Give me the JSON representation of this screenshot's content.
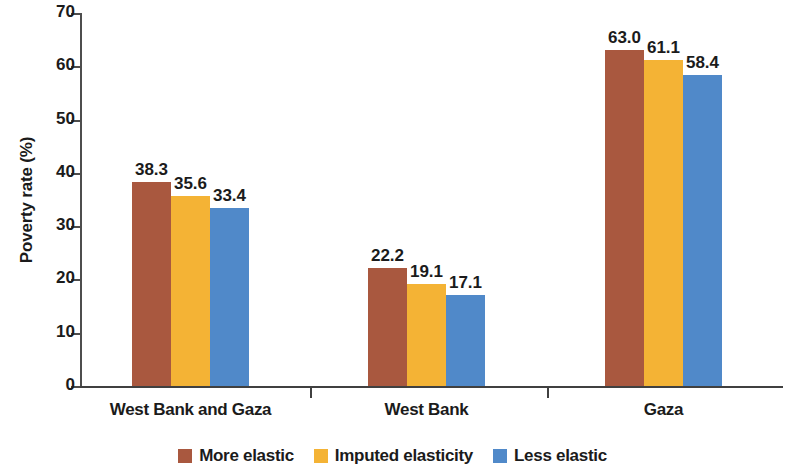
{
  "chart_data": {
    "type": "bar",
    "title": "",
    "xlabel": "",
    "ylabel": "Poverty rate (%)",
    "ylim": [
      0,
      70
    ],
    "yticks": [
      0,
      10,
      20,
      30,
      40,
      50,
      60,
      70
    ],
    "ytick_labels": [
      "0",
      "10",
      "20",
      "30",
      "40",
      "50",
      "60",
      "70"
    ],
    "grid": false,
    "legend_position": "bottom-center",
    "categories": [
      "West Bank and Gaza",
      "West Bank",
      "Gaza"
    ],
    "series": [
      {
        "name": "More elastic",
        "color": "#a9583f",
        "values": [
          38.3,
          63.0,
          22.2
        ],
        "value_labels": [
          "38.3",
          "22.2",
          "63.0"
        ]
      },
      {
        "name": "Imputed elasticity",
        "color": "#f4b335",
        "values": [
          35.6,
          19.1,
          61.1
        ],
        "value_labels": [
          "35.6",
          "19.1",
          "61.1"
        ]
      },
      {
        "name": "Less elastic",
        "color": "#5089c9",
        "values": [
          33.4,
          17.1,
          58.4
        ],
        "value_labels": [
          "33.4",
          "17.1",
          "58.4"
        ]
      }
    ],
    "groups": [
      {
        "category": "West Bank and Gaza",
        "bars": [
          {
            "series": "More elastic",
            "value": 38.3,
            "label": "38.3",
            "color": "#a9583f"
          },
          {
            "series": "Imputed elasticity",
            "value": 35.6,
            "label": "35.6",
            "color": "#f4b335"
          },
          {
            "series": "Less elastic",
            "value": 33.4,
            "label": "33.4",
            "color": "#5089c9"
          }
        ]
      },
      {
        "category": "West Bank",
        "bars": [
          {
            "series": "More elastic",
            "value": 22.2,
            "label": "22.2",
            "color": "#a9583f"
          },
          {
            "series": "Imputed elasticity",
            "value": 19.1,
            "label": "19.1",
            "color": "#f4b335"
          },
          {
            "series": "Less elastic",
            "value": 17.1,
            "label": "17.1",
            "color": "#5089c9"
          }
        ]
      },
      {
        "category": "Gaza",
        "bars": [
          {
            "series": "More elastic",
            "value": 63.0,
            "label": "63.0",
            "color": "#a9583f"
          },
          {
            "series": "Imputed elasticity",
            "value": 61.1,
            "label": "61.1",
            "color": "#f4b335"
          },
          {
            "series": "Less elastic",
            "value": 58.4,
            "label": "58.4",
            "color": "#5089c9"
          }
        ]
      }
    ]
  },
  "legend": {
    "items": [
      {
        "label": "More elastic",
        "color": "#a9583f"
      },
      {
        "label": "Imputed elasticity",
        "color": "#f4b335"
      },
      {
        "label": "Less elastic",
        "color": "#5089c9"
      }
    ]
  },
  "axes": {
    "y_title": "Poverty rate (%)",
    "y_tick_labels": [
      "70",
      "60",
      "50",
      "40",
      "30",
      "20",
      "10",
      "0"
    ],
    "x_category_labels": [
      "West Bank and Gaza",
      "West Bank",
      "Gaza"
    ]
  }
}
